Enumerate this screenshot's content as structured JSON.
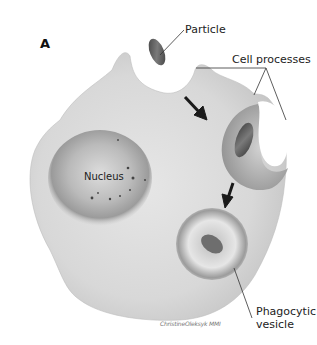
{
  "figure": {
    "panel_letter": "A",
    "labels": {
      "particle": "Particle",
      "cell_processes": "Cell processes",
      "nucleus": "Nucleus",
      "phagocytic_vesicle_line1": "Phagocytic",
      "phagocytic_vesicle_line2": "vesicle"
    },
    "signature": "ChristineOleksyk MMI",
    "colors": {
      "cell_body": "#d9d9d9",
      "cell_highlight": "#ededed",
      "nucleus_shadow": "#8a8a8a",
      "particle": "#5a5a5a",
      "arrow": "#1a1a1a",
      "leader_line": "#333333"
    }
  }
}
